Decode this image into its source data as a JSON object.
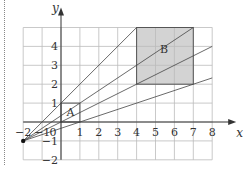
{
  "diagram": {
    "type": "enlargement",
    "axes": {
      "x_label": "x",
      "y_label": "y",
      "x_range": [
        -2,
        8
      ],
      "y_range": [
        -2,
        5
      ],
      "x_ticks": [
        "-2",
        "-1",
        "0",
        "1",
        "2",
        "3",
        "4",
        "5",
        "6",
        "7",
        "8"
      ],
      "y_ticks": [
        "-2",
        "-1",
        "1",
        "2",
        "3",
        "4"
      ]
    },
    "center_point": {
      "x": -2,
      "y": -1
    },
    "shapes": [
      {
        "label": "A",
        "x1": 0,
        "y1": 0,
        "x2": 1,
        "y2": 1,
        "fill": "none"
      },
      {
        "label": "B",
        "x1": 4,
        "y1": 2,
        "x2": 7,
        "y2": 5,
        "fill": "#d3d3d3"
      }
    ],
    "rays": [
      {
        "through": [
          0,
          1
        ],
        "end": [
          4,
          5
        ]
      },
      {
        "through": [
          1,
          1
        ],
        "end": [
          7,
          5
        ]
      },
      {
        "through": [
          0,
          0
        ],
        "end": [
          8,
          4
        ]
      },
      {
        "through": [
          1,
          0
        ],
        "end": [
          8,
          2.333
        ]
      }
    ],
    "colors": {
      "grid": "#bbbbbb",
      "axis": "#333333",
      "shaded": "#d3d3d3",
      "line": "#444444"
    }
  }
}
